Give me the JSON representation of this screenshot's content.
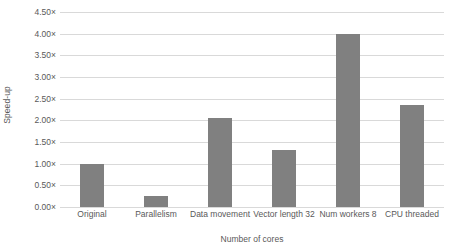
{
  "chart_data": {
    "type": "bar",
    "title": "",
    "xlabel": "Number of cores",
    "ylabel": "Speed-up",
    "categories": [
      "Original",
      "Parallelism",
      "Data movement",
      "Vector length 32",
      "Num workers 8",
      "CPU threaded"
    ],
    "values": [
      1.0,
      0.25,
      2.05,
      1.32,
      4.0,
      2.35
    ],
    "ylim": [
      0.0,
      4.5
    ],
    "ytick_values": [
      0.0,
      0.5,
      1.0,
      1.5,
      2.0,
      2.5,
      3.0,
      3.5,
      4.0,
      4.5
    ],
    "ytick_labels": [
      "0.00×",
      "0.50×",
      "1.00×",
      "1.50×",
      "2.00×",
      "2.50×",
      "3.00×",
      "3.50×",
      "4.00×",
      "4.50×"
    ],
    "grid": true,
    "legend": false,
    "legend_position": "none",
    "bar_color": "#808080",
    "gridline_color": "#d9d9d9",
    "text_color": "#595959",
    "background_color": "#ffffff"
  }
}
